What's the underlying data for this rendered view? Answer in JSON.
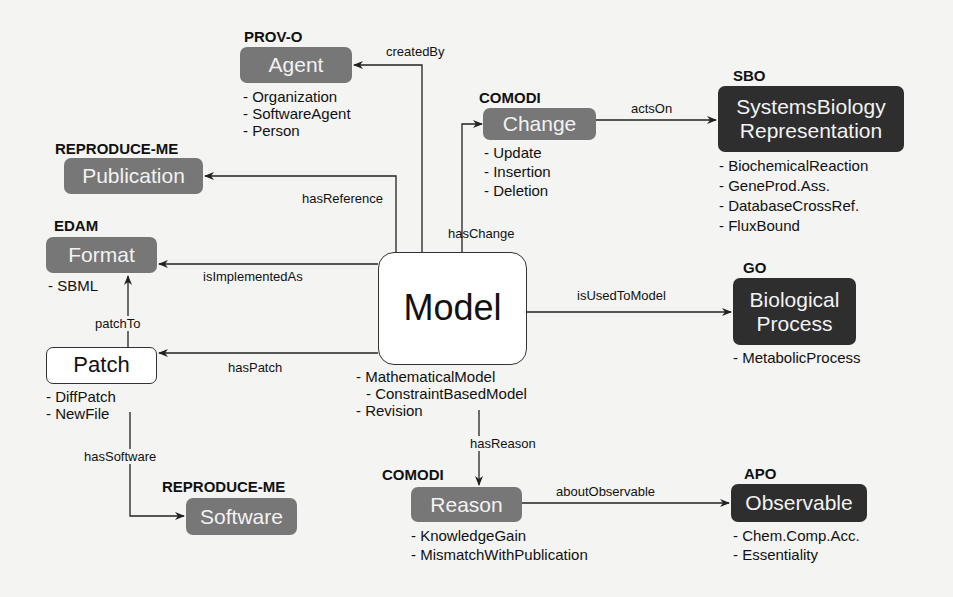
{
  "diagram": {
    "center": {
      "label": "Model",
      "subclasses": [
        "- MathematicalModel",
        "  - ConstraintBasedModel",
        "- Revision"
      ]
    },
    "nodes": {
      "agent": {
        "ontology": "PROV-O",
        "label": "Agent",
        "subclasses": [
          "- Organization",
          "- SoftwareAgent",
          "- Person"
        ],
        "style": "gray"
      },
      "publication": {
        "ontology": "REPRODUCE-ME",
        "label": "Publication",
        "subclasses": [],
        "style": "gray"
      },
      "format": {
        "ontology": "EDAM",
        "label": "Format",
        "subclasses": [
          "- SBML"
        ],
        "style": "gray"
      },
      "patch": {
        "ontology": "",
        "label": "Patch",
        "subclasses": [
          "- DiffPatch",
          "- NewFile"
        ],
        "style": "white"
      },
      "software": {
        "ontology": "REPRODUCE-ME",
        "label": "Software",
        "subclasses": [],
        "style": "gray"
      },
      "change": {
        "ontology": "COMODI",
        "label": "Change",
        "subclasses": [
          "- Update",
          "- Insertion",
          "- Deletion"
        ],
        "style": "gray"
      },
      "sbo": {
        "ontology": "SBO",
        "label_line1": "SystemsBiology",
        "label_line2": "Representation",
        "subclasses": [
          "- BiochemicalReaction",
          "- GeneProd.Ass.",
          "- DatabaseCrossRef.",
          "- FluxBound"
        ],
        "style": "dark"
      },
      "go": {
        "ontology": "GO",
        "label_line1": "Biological",
        "label_line2": "Process",
        "subclasses": [
          "- MetabolicProcess"
        ],
        "style": "dark"
      },
      "reason": {
        "ontology": "COMODI",
        "label": "Reason",
        "subclasses": [
          "- KnowledgeGain",
          "- MismatchWithPublication"
        ],
        "style": "gray"
      },
      "observable": {
        "ontology": "APO",
        "label": "Observable",
        "subclasses": [
          "- Chem.Comp.Acc.",
          "- Essentiality"
        ],
        "style": "dark"
      }
    },
    "edges": {
      "createdBy": "createdBy",
      "hasReference": "hasReference",
      "hasChange": "hasChange",
      "actsOn": "actsOn",
      "isImplementedAs": "isImplementedAs",
      "isUsedToModel": "isUsedToModel",
      "patchTo": "patchTo",
      "hasPatch": "hasPatch",
      "hasSoftware": "hasSoftware",
      "hasReason": "hasReason",
      "aboutObservable": "aboutObservable"
    },
    "colors": {
      "gray_box": "#777777",
      "dark_box": "#2e2e2e",
      "line": "#222222",
      "background": "#f4f4f2"
    }
  }
}
